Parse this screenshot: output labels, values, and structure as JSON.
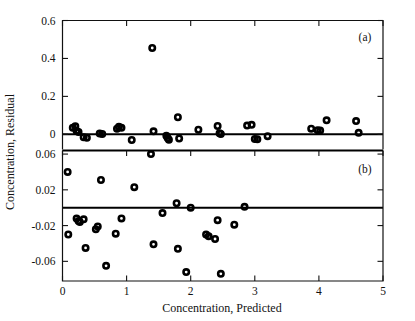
{
  "chart_data": {
    "type": "scatter",
    "title": "",
    "xlabel": "Concentration, Predicted",
    "ylabel": "Concentration, Residual",
    "xlim": [
      0,
      5
    ],
    "xticks": [
      0,
      1,
      2,
      3,
      4,
      5
    ],
    "xticklabels": [
      "0",
      "1",
      "2",
      "3",
      "4",
      "5"
    ],
    "grid": false,
    "legend": false,
    "marker_style": "open-circle",
    "panels": [
      {
        "tag": "(a)",
        "ylim": [
          -0.08,
          0.6
        ],
        "yticks": [
          0,
          0.2,
          0.4,
          0.6
        ],
        "yticklabels": [
          "0",
          "0.2",
          "0.4",
          "0.6"
        ],
        "reference_line": 0,
        "points": [
          {
            "x": 0.16,
            "y": 0.035
          },
          {
            "x": 0.2,
            "y": 0.042
          },
          {
            "x": 0.22,
            "y": 0.018
          },
          {
            "x": 0.25,
            "y": 0.012
          },
          {
            "x": 0.33,
            "y": -0.015
          },
          {
            "x": 0.38,
            "y": -0.018
          },
          {
            "x": 0.58,
            "y": 0.004
          },
          {
            "x": 0.62,
            "y": 0.002
          },
          {
            "x": 0.85,
            "y": 0.03
          },
          {
            "x": 0.88,
            "y": 0.04
          },
          {
            "x": 0.92,
            "y": 0.034
          },
          {
            "x": 1.08,
            "y": -0.03
          },
          {
            "x": 1.4,
            "y": 0.455
          },
          {
            "x": 1.42,
            "y": 0.016
          },
          {
            "x": 1.62,
            "y": -0.008
          },
          {
            "x": 1.64,
            "y": -0.02
          },
          {
            "x": 1.66,
            "y": -0.028
          },
          {
            "x": 1.8,
            "y": 0.09
          },
          {
            "x": 1.82,
            "y": -0.022
          },
          {
            "x": 2.12,
            "y": 0.024
          },
          {
            "x": 2.42,
            "y": 0.044
          },
          {
            "x": 2.45,
            "y": 0.006
          },
          {
            "x": 2.47,
            "y": 0.002
          },
          {
            "x": 2.88,
            "y": 0.046
          },
          {
            "x": 2.95,
            "y": 0.05
          },
          {
            "x": 3.0,
            "y": -0.024
          },
          {
            "x": 3.04,
            "y": -0.026
          },
          {
            "x": 3.2,
            "y": -0.01
          },
          {
            "x": 3.88,
            "y": 0.03
          },
          {
            "x": 3.98,
            "y": 0.022
          },
          {
            "x": 4.02,
            "y": 0.02
          },
          {
            "x": 4.12,
            "y": 0.074
          },
          {
            "x": 4.58,
            "y": 0.07
          },
          {
            "x": 4.62,
            "y": 0.008
          }
        ]
      },
      {
        "tag": "(b)",
        "ylim": [
          -0.082,
          0.064
        ],
        "yticks": [
          0.06,
          0.02,
          -0.02,
          -0.06
        ],
        "yticklabels": [
          "0.06",
          "0.02",
          "-0.02",
          "-0.06"
        ],
        "reference_line": 0,
        "points": [
          {
            "x": 0.08,
            "y": 0.04
          },
          {
            "x": 0.09,
            "y": -0.03
          },
          {
            "x": 0.22,
            "y": -0.012
          },
          {
            "x": 0.25,
            "y": -0.015
          },
          {
            "x": 0.27,
            "y": -0.016
          },
          {
            "x": 0.33,
            "y": -0.013
          },
          {
            "x": 0.36,
            "y": -0.045
          },
          {
            "x": 0.52,
            "y": -0.024
          },
          {
            "x": 0.55,
            "y": -0.021
          },
          {
            "x": 0.6,
            "y": 0.031
          },
          {
            "x": 0.68,
            "y": -0.065
          },
          {
            "x": 0.83,
            "y": -0.029
          },
          {
            "x": 0.92,
            "y": -0.012
          },
          {
            "x": 1.12,
            "y": 0.023
          },
          {
            "x": 1.38,
            "y": 0.06
          },
          {
            "x": 1.42,
            "y": -0.041
          },
          {
            "x": 1.56,
            "y": -0.006
          },
          {
            "x": 1.78,
            "y": 0.005
          },
          {
            "x": 1.8,
            "y": -0.046
          },
          {
            "x": 1.93,
            "y": -0.072
          },
          {
            "x": 2.0,
            "y": 0.0
          },
          {
            "x": 2.24,
            "y": -0.03
          },
          {
            "x": 2.28,
            "y": -0.032
          },
          {
            "x": 2.38,
            "y": -0.035
          },
          {
            "x": 2.42,
            "y": -0.014
          },
          {
            "x": 2.47,
            "y": -0.074
          },
          {
            "x": 2.68,
            "y": -0.019
          },
          {
            "x": 2.84,
            "y": 0.001
          }
        ]
      }
    ]
  }
}
